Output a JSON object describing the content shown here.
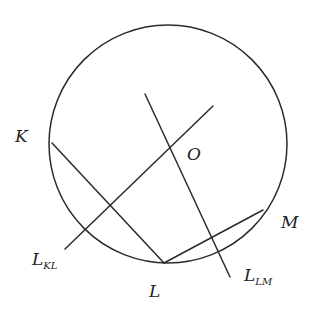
{
  "figure": {
    "type": "geometry-diagram",
    "colors": {
      "stroke": "#2b2b2b",
      "text": "#222222",
      "background": "#ffffff"
    },
    "circle": {
      "cx": 168,
      "cy": 144,
      "r": 119
    },
    "points": {
      "K": {
        "x": 52,
        "y": 143
      },
      "L": {
        "x": 164,
        "y": 263
      },
      "M": {
        "x": 263,
        "y": 210
      },
      "O": {
        "x": 170,
        "y": 148
      }
    },
    "segments": [
      {
        "name": "chord-KL",
        "from": "K",
        "to": "L"
      },
      {
        "name": "chord-LM",
        "from": "L",
        "to": "M"
      }
    ],
    "lines": [
      {
        "name": "bisector-KL",
        "x1": 65,
        "y1": 249,
        "x2": 213,
        "y2": 106
      },
      {
        "name": "bisector-LM",
        "x1": 145,
        "y1": 94,
        "x2": 230,
        "y2": 277
      }
    ],
    "labels": {
      "K": {
        "text": "K",
        "x": 15,
        "y": 142
      },
      "O": {
        "text": "O",
        "x": 187,
        "y": 160
      },
      "M": {
        "text": "M",
        "x": 281,
        "y": 228
      },
      "L": {
        "text": "L",
        "x": 149,
        "y": 297
      },
      "L_KL": {
        "main": "L",
        "sub": "KL",
        "x": 32,
        "y": 265
      },
      "L_LM": {
        "main": "L",
        "sub": "LM",
        "x": 244,
        "y": 281
      }
    }
  }
}
